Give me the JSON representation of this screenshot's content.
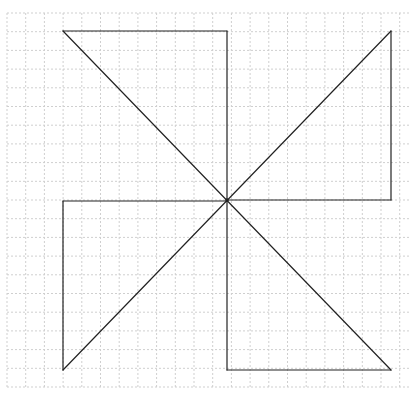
{
  "diagram": {
    "type": "pinwheel-figure-on-grid",
    "grid": {
      "x_start": 7,
      "x_end": 409,
      "y_start": 13,
      "y_end": 389,
      "spacing": 18.7,
      "color": "#cfcfcf",
      "dash": "2,2"
    },
    "stroke_color": "#222222",
    "center": [
      227,
      200
    ],
    "segments": [
      {
        "name": "top-edge",
        "from": [
          63,
          31
        ],
        "to": [
          227,
          31
        ]
      },
      {
        "name": "top-vertical",
        "from": [
          227,
          31
        ],
        "to": [
          227,
          200
        ]
      },
      {
        "name": "diag-tl-br",
        "from": [
          63,
          31
        ],
        "to": [
          391,
          370
        ]
      },
      {
        "name": "right-vertical",
        "from": [
          391,
          31
        ],
        "to": [
          391,
          200
        ]
      },
      {
        "name": "right-horizontal",
        "from": [
          227,
          200
        ],
        "to": [
          391,
          200
        ]
      },
      {
        "name": "diag-tr-bl",
        "from": [
          391,
          31
        ],
        "to": [
          63,
          370
        ]
      },
      {
        "name": "left-horizontal",
        "from": [
          63,
          201
        ],
        "to": [
          227,
          201
        ]
      },
      {
        "name": "left-vertical",
        "from": [
          63,
          201
        ],
        "to": [
          63,
          370
        ]
      },
      {
        "name": "bottom-vertical",
        "from": [
          227,
          200
        ],
        "to": [
          227,
          370
        ]
      },
      {
        "name": "bottom-edge",
        "from": [
          227,
          370
        ],
        "to": [
          391,
          370
        ]
      }
    ]
  }
}
